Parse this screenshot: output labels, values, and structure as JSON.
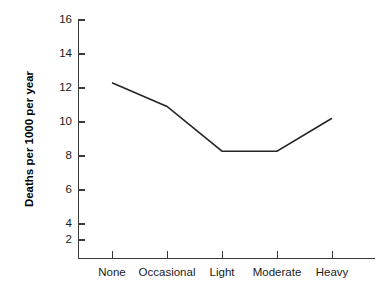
{
  "chart_data": {
    "type": "line",
    "title": "",
    "subtitle": "",
    "xlabel": "",
    "ylabel": "Deaths per 1000 per year",
    "categories": [
      "None",
      "Occasional",
      "Light",
      "Moderate",
      "Heavy"
    ],
    "values": [
      12.0,
      10.5,
      7.65,
      7.65,
      9.75
    ],
    "series": [
      {
        "name": "Deaths per 1000 per year",
        "values": [
          12.0,
          10.5,
          7.65,
          7.65,
          9.75
        ]
      }
    ],
    "ylim": [
      0,
      16
    ],
    "yticks": [
      2,
      4,
      6,
      8,
      10,
      12,
      14,
      16
    ],
    "ytick_labels": [
      "2",
      "4",
      "6",
      "8",
      "10",
      "12",
      "14",
      "16"
    ],
    "xtick_labels": [
      "None",
      "Occasional",
      "Light",
      "Moderate",
      "Heavy"
    ],
    "grid": false,
    "legend": false,
    "legend_position": "none",
    "line_color": "#262626",
    "axis_color": "#3a3a3a",
    "background_color": "#ffffff",
    "annotations": []
  }
}
